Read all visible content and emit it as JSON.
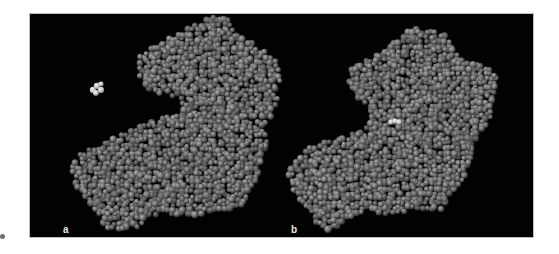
{
  "figure": {
    "background_color": "#020202",
    "atom_color": "#7a7a7a",
    "atom_highlight": "#b4b4b4",
    "atom_shadow": "#2a2a2a",
    "ligand_color": "#d8d8d8",
    "panels": [
      {
        "label": "a",
        "label_pos": [
          63,
          225
        ],
        "description": "space-filling model of protein, open conformation, ligand separated",
        "outline": [
          [
            198,
            22
          ],
          [
            214,
            16
          ],
          [
            228,
            20
          ],
          [
            236,
            34
          ],
          [
            250,
            42
          ],
          [
            264,
            50
          ],
          [
            276,
            60
          ],
          [
            280,
            78
          ],
          [
            278,
            100
          ],
          [
            272,
            116
          ],
          [
            262,
            126
          ],
          [
            268,
            140
          ],
          [
            262,
            160
          ],
          [
            256,
            178
          ],
          [
            250,
            196
          ],
          [
            240,
            206
          ],
          [
            224,
            210
          ],
          [
            206,
            214
          ],
          [
            186,
            216
          ],
          [
            166,
            214
          ],
          [
            150,
            216
          ],
          [
            136,
            228
          ],
          [
            118,
            232
          ],
          [
            104,
            226
          ],
          [
            96,
            212
          ],
          [
            84,
            196
          ],
          [
            74,
            184
          ],
          [
            72,
            166
          ],
          [
            80,
            154
          ],
          [
            96,
            146
          ],
          [
            112,
            138
          ],
          [
            128,
            132
          ],
          [
            146,
            124
          ],
          [
            160,
            118
          ],
          [
            176,
            116
          ],
          [
            184,
            110
          ],
          [
            180,
            100
          ],
          [
            168,
            94
          ],
          [
            152,
            92
          ],
          [
            142,
            84
          ],
          [
            138,
            70
          ],
          [
            140,
            56
          ],
          [
            150,
            46
          ],
          [
            166,
            40
          ],
          [
            180,
            32
          ]
        ],
        "ligand": {
          "cx": 97,
          "cy": 88,
          "atoms": [
            [
              93,
              90,
              3.2
            ],
            [
              97,
              86,
              3.2
            ],
            [
              101,
              90,
              3.2
            ],
            [
              96,
              93,
              3.0
            ],
            [
              101,
              84,
              2.6
            ]
          ]
        }
      },
      {
        "label": "b",
        "label_pos": [
          291,
          225
        ],
        "description": "space-filling model of protein, closed conformation, ligand bound",
        "outline": [
          [
            402,
            34
          ],
          [
            416,
            28
          ],
          [
            432,
            30
          ],
          [
            446,
            36
          ],
          [
            454,
            46
          ],
          [
            460,
            58
          ],
          [
            476,
            62
          ],
          [
            490,
            66
          ],
          [
            497,
            80
          ],
          [
            496,
            100
          ],
          [
            492,
            118
          ],
          [
            484,
            130
          ],
          [
            476,
            144
          ],
          [
            470,
            162
          ],
          [
            462,
            182
          ],
          [
            450,
            196
          ],
          [
            440,
            212
          ],
          [
            426,
            208
          ],
          [
            408,
            212
          ],
          [
            390,
            214
          ],
          [
            370,
            212
          ],
          [
            356,
            214
          ],
          [
            342,
            226
          ],
          [
            326,
            232
          ],
          [
            316,
            222
          ],
          [
            306,
            206
          ],
          [
            294,
            194
          ],
          [
            288,
            178
          ],
          [
            294,
            160
          ],
          [
            308,
            148
          ],
          [
            326,
            142
          ],
          [
            344,
            136
          ],
          [
            362,
            130
          ],
          [
            372,
            120
          ],
          [
            368,
            108
          ],
          [
            354,
            94
          ],
          [
            348,
            80
          ],
          [
            352,
            68
          ],
          [
            366,
            60
          ],
          [
            382,
            52
          ],
          [
            394,
            42
          ]
        ],
        "ligand": {
          "cx": 395,
          "cy": 122,
          "atoms": [
            [
              391,
              122,
              2.8
            ],
            [
              395,
              121,
              2.8
            ],
            [
              399,
              122,
              2.8
            ]
          ]
        }
      }
    ],
    "margin_marker": {
      "x": 0,
      "y": 234
    }
  }
}
